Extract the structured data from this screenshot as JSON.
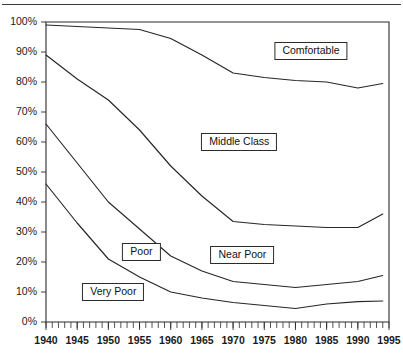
{
  "figure": {
    "has_top_rule": true,
    "background_color": "#ffffff",
    "line_color": "#262626"
  },
  "chart_data": {
    "type": "line",
    "title": "",
    "subtitle": "",
    "xlabel": "",
    "ylabel": "",
    "grid": false,
    "legend_position": "inline-boxes",
    "xlim": [
      1940,
      1995
    ],
    "ylim": [
      0,
      100
    ],
    "x_tick_labels": [
      "1940",
      "1945",
      "1950",
      "1955",
      "1960",
      "1965",
      "1970",
      "1975",
      "1980",
      "1985",
      "1990",
      "1995"
    ],
    "x_tick_values": [
      1940,
      1945,
      1950,
      1955,
      1960,
      1965,
      1970,
      1975,
      1980,
      1985,
      1990,
      1995
    ],
    "x_minor_tick_step": 1,
    "y_tick_labels": [
      "0%",
      "10%",
      "20%",
      "30%",
      "40%",
      "50%",
      "60%",
      "70%",
      "80%",
      "90%",
      "100%"
    ],
    "y_tick_values": [
      0,
      10,
      20,
      30,
      40,
      50,
      60,
      70,
      80,
      90,
      100
    ],
    "x": [
      1940,
      1945,
      1950,
      1955,
      1960,
      1965,
      1970,
      1975,
      1980,
      1985,
      1990,
      1994
    ],
    "series": [
      {
        "name": "Comfortable boundary",
        "description": "cumulative upper boundary, top of Middle Class band",
        "values": [
          99,
          98.5,
          98,
          97.5,
          94.5,
          89,
          83,
          81.5,
          80.5,
          80,
          78,
          79.5
        ]
      },
      {
        "name": "Middle Class boundary",
        "description": "cumulative boundary between Near Poor and Middle Class",
        "values": [
          89,
          81,
          74,
          64,
          52,
          42,
          33.5,
          32.5,
          32,
          31.5,
          31.5,
          36
        ]
      },
      {
        "name": "Near Poor boundary",
        "description": "cumulative boundary between Poor and Near Poor",
        "values": [
          66,
          53,
          40,
          31,
          22,
          17,
          13.5,
          12.5,
          11.5,
          12.5,
          13.5,
          15.5
        ]
      },
      {
        "name": "Very Poor boundary",
        "description": "cumulative boundary between Very Poor and Poor",
        "values": [
          46,
          33,
          21,
          15,
          10,
          8,
          6.5,
          5.5,
          4.5,
          6,
          6.8,
          7
        ]
      }
    ],
    "band_labels": [
      {
        "id": "comfortable",
        "text": "Comfortable"
      },
      {
        "id": "middle-class",
        "text": "Middle Class"
      },
      {
        "id": "poor",
        "text": "Poor"
      },
      {
        "id": "near-poor",
        "text": "Near Poor"
      },
      {
        "id": "very-poor",
        "text": "Very Poor"
      }
    ]
  },
  "labels": {
    "comfortable": "Comfortable",
    "middle_class": "Middle Class",
    "poor": "Poor",
    "near_poor": "Near Poor",
    "very_poor": "Very Poor"
  }
}
